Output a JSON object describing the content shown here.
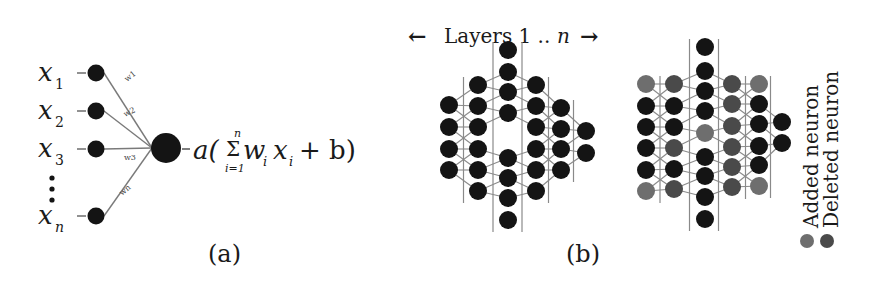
{
  "panel_a": {
    "caption": "(a)",
    "inputs": [
      {
        "label": "x",
        "sub": "1",
        "y": 73
      },
      {
        "label": "x",
        "sub": "2",
        "y": 111
      },
      {
        "label": "x",
        "sub": "3",
        "y": 149
      },
      {
        "label": "x",
        "sub": "n",
        "y": 216
      }
    ],
    "weights": [
      "w1",
      "w2",
      "w3",
      "wn"
    ],
    "ellipsis": "⋮",
    "formula": {
      "activation": "a(",
      "sum_symbol": "Σ",
      "sum_upper": "n",
      "sum_lower": "i=1",
      "term_w": "w",
      "term_w_sub": "i",
      "term_x": "x",
      "term_x_sub": "i",
      "plus_b": "+ b)"
    }
  },
  "panel_b": {
    "caption": "(b)",
    "header": {
      "left_arrow": "←",
      "text_prefix": "Layers 1 .. ",
      "text_n": "n",
      "right_arrow": "→"
    },
    "colors": {
      "normal": "#141414",
      "added": "#6e6e6e",
      "deleted": "#4a4a4a",
      "edge": "#8a8a8a"
    },
    "original_network": {
      "columns": [
        {
          "x": 449,
          "nodes": [
            {
              "y": 105,
              "t": "n"
            },
            {
              "y": 127,
              "t": "n"
            },
            {
              "y": 149,
              "t": "n"
            },
            {
              "y": 170,
              "t": "n"
            }
          ]
        },
        {
          "x": 478,
          "nodes": [
            {
              "y": 85,
              "t": "n"
            },
            {
              "y": 106,
              "t": "n"
            },
            {
              "y": 127,
              "t": "n"
            },
            {
              "y": 149,
              "t": "n"
            },
            {
              "y": 170,
              "t": "n"
            },
            {
              "y": 191,
              "t": "n"
            }
          ]
        },
        {
          "x": 508,
          "nodes": [
            {
              "y": 50,
              "t": "n"
            },
            {
              "y": 72,
              "t": "n"
            },
            {
              "y": 92,
              "t": "n"
            },
            {
              "y": 113,
              "t": "n"
            },
            {
              "y": 158,
              "t": "n"
            },
            {
              "y": 178,
              "t": "n"
            },
            {
              "y": 198,
              "t": "n"
            },
            {
              "y": 220,
              "t": "n"
            }
          ]
        },
        {
          "x": 536,
          "nodes": [
            {
              "y": 85,
              "t": "n"
            },
            {
              "y": 106,
              "t": "n"
            },
            {
              "y": 127,
              "t": "n"
            },
            {
              "y": 149,
              "t": "n"
            },
            {
              "y": 170,
              "t": "n"
            },
            {
              "y": 191,
              "t": "n"
            }
          ]
        },
        {
          "x": 561,
          "nodes": [
            {
              "y": 108,
              "t": "n"
            },
            {
              "y": 129,
              "t": "n"
            },
            {
              "y": 149,
              "t": "n"
            },
            {
              "y": 170,
              "t": "n"
            }
          ]
        },
        {
          "x": 586,
          "nodes": [
            {
              "y": 131,
              "t": "n"
            },
            {
              "y": 153,
              "t": "n"
            }
          ]
        }
      ]
    },
    "modified_network": {
      "columns": [
        {
          "x": 646,
          "nodes": [
            {
              "y": 84,
              "t": "a"
            },
            {
              "y": 106,
              "t": "n"
            },
            {
              "y": 127,
              "t": "n"
            },
            {
              "y": 148,
              "t": "n"
            },
            {
              "y": 170,
              "t": "n"
            },
            {
              "y": 191,
              "t": "a"
            }
          ]
        },
        {
          "x": 674,
          "nodes": [
            {
              "y": 84,
              "t": "d"
            },
            {
              "y": 106,
              "t": "n"
            },
            {
              "y": 127,
              "t": "n"
            },
            {
              "y": 148,
              "t": "d"
            },
            {
              "y": 169,
              "t": "n"
            },
            {
              "y": 189,
              "t": "d"
            }
          ]
        },
        {
          "x": 705,
          "nodes": [
            {
              "y": 47,
              "t": "n"
            },
            {
              "y": 71,
              "t": "n"
            },
            {
              "y": 91,
              "t": "n"
            },
            {
              "y": 111,
              "t": "n"
            },
            {
              "y": 133,
              "t": "a"
            },
            {
              "y": 157,
              "t": "n"
            },
            {
              "y": 176,
              "t": "n"
            },
            {
              "y": 197,
              "t": "n"
            },
            {
              "y": 219,
              "t": "n"
            }
          ]
        },
        {
          "x": 732,
          "nodes": [
            {
              "y": 84,
              "t": "d"
            },
            {
              "y": 104,
              "t": "d"
            },
            {
              "y": 126,
              "t": "d"
            },
            {
              "y": 147,
              "t": "d"
            },
            {
              "y": 167,
              "t": "d"
            },
            {
              "y": 187,
              "t": "d"
            }
          ]
        },
        {
          "x": 759,
          "nodes": [
            {
              "y": 84,
              "t": "a"
            },
            {
              "y": 104,
              "t": "n"
            },
            {
              "y": 124,
              "t": "n"
            },
            {
              "y": 146,
              "t": "n"
            },
            {
              "y": 165,
              "t": "n"
            },
            {
              "y": 186,
              "t": "a"
            }
          ]
        },
        {
          "x": 782,
          "nodes": [
            {
              "y": 122,
              "t": "n"
            },
            {
              "y": 143,
              "t": "n"
            }
          ]
        }
      ]
    },
    "legend": [
      {
        "label": "Added neuron",
        "color": "#6e6e6e"
      },
      {
        "label": "Deleted neuron",
        "color": "#4a4a4a"
      }
    ]
  }
}
